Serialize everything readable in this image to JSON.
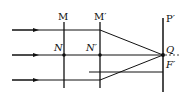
{
  "diagram": {
    "type": "optics-ray-diagram",
    "labels": {
      "M": "M",
      "M_prime": "M′",
      "P_prime": "P′",
      "N": "N",
      "N_prime": "N′",
      "Q": "Q",
      "F_prime": "F′"
    },
    "colors": {
      "line": "#111111",
      "background": "#ffffff"
    }
  }
}
